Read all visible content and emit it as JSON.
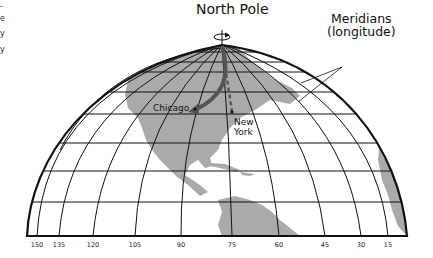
{
  "diagram": {
    "title": "North Pole",
    "meridians_label_line1": "Meridians",
    "meridians_label_line2": "(longitude)",
    "cities": [
      {
        "name": "Chicago"
      },
      {
        "name_line1": "New",
        "name_line2": "York"
      }
    ],
    "longitude_ticks": [
      "150",
      "135",
      "120",
      "105",
      "90",
      "75",
      "60",
      "45",
      "30",
      "15"
    ],
    "left_edge_fragments": [
      "-",
      "e",
      "y",
      "y"
    ],
    "colors": {
      "land": "#aaaaaa",
      "grid": "#111111",
      "arrow": "#555555",
      "background": "#ffffff"
    }
  }
}
